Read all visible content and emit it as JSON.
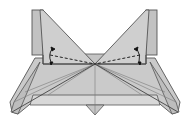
{
  "figure": {
    "colors": {
      "paper": "#c8c8c8",
      "paper_light": "#d6d6d6",
      "paper_dark": "#b4b4b4",
      "line": "#555555",
      "thin_line": "#8a8a8a",
      "background": "#ffffff"
    },
    "symbols": [
      "valley-fold-dashed-line-left",
      "valley-fold-dashed-line-right",
      "fold-arrow-left",
      "fold-arrow-right"
    ]
  }
}
